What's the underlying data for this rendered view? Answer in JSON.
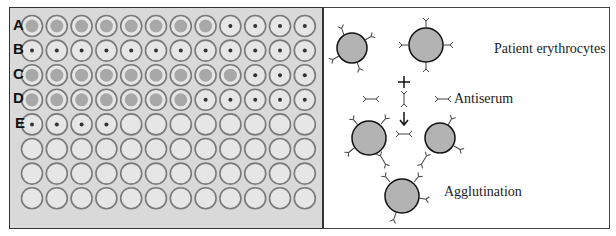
{
  "plate": {
    "rows": [
      "A",
      "B",
      "C",
      "D",
      "E",
      "F",
      "G",
      "H"
    ],
    "row_labels": [
      "A",
      "B",
      "C",
      "D",
      "E"
    ],
    "columns": 12,
    "wells": {
      "A": [
        "diffuse",
        "diffuse",
        "diffuse",
        "diffuse",
        "diffuse",
        "diffuse",
        "diffuse",
        "diffuse",
        "button",
        "button",
        "button",
        "button"
      ],
      "B": [
        "button",
        "button",
        "button",
        "button",
        "button",
        "button",
        "button",
        "button",
        "button",
        "button",
        "button",
        "button"
      ],
      "C": [
        "diffuse",
        "diffuse",
        "diffuse",
        "diffuse",
        "diffuse",
        "diffuse",
        "diffuse",
        "diffuse",
        "diffuse",
        "button",
        "button",
        "button"
      ],
      "D": [
        "diffuse",
        "diffuse",
        "diffuse",
        "diffuse",
        "diffuse",
        "diffuse",
        "diffuse",
        "button",
        "button",
        "button",
        "button",
        "button"
      ],
      "E": [
        "button",
        "button",
        "button",
        "button",
        "empty",
        "empty",
        "empty",
        "empty",
        "empty",
        "empty",
        "empty",
        "empty"
      ],
      "F": [
        "empty",
        "empty",
        "empty",
        "empty",
        "empty",
        "empty",
        "empty",
        "empty",
        "empty",
        "empty",
        "empty",
        "empty"
      ],
      "G": [
        "empty",
        "empty",
        "empty",
        "empty",
        "empty",
        "empty",
        "empty",
        "empty",
        "empty",
        "empty",
        "empty",
        "empty"
      ],
      "H": [
        "empty",
        "empty",
        "empty",
        "empty",
        "empty",
        "empty",
        "empty",
        "empty",
        "empty",
        "empty",
        "empty",
        "empty"
      ]
    },
    "colors": {
      "background": "#d9d9d9",
      "well_ring": "#7a7a7a",
      "well_fill": "#e6e6e6",
      "diffuse_fill": "#a8a8a8",
      "button_dot": "#333333"
    }
  },
  "diagram": {
    "labels": {
      "erythrocytes": "Patient erythrocytes",
      "antiserum": "Antiserum",
      "agglutination": "Agglutination"
    },
    "symbols": {
      "plus": "+",
      "arrow": "down-arrow"
    },
    "colors": {
      "cell_fill": "#b3b3b3",
      "cell_stroke": "#111111",
      "antibody_stroke": "#444444"
    }
  }
}
